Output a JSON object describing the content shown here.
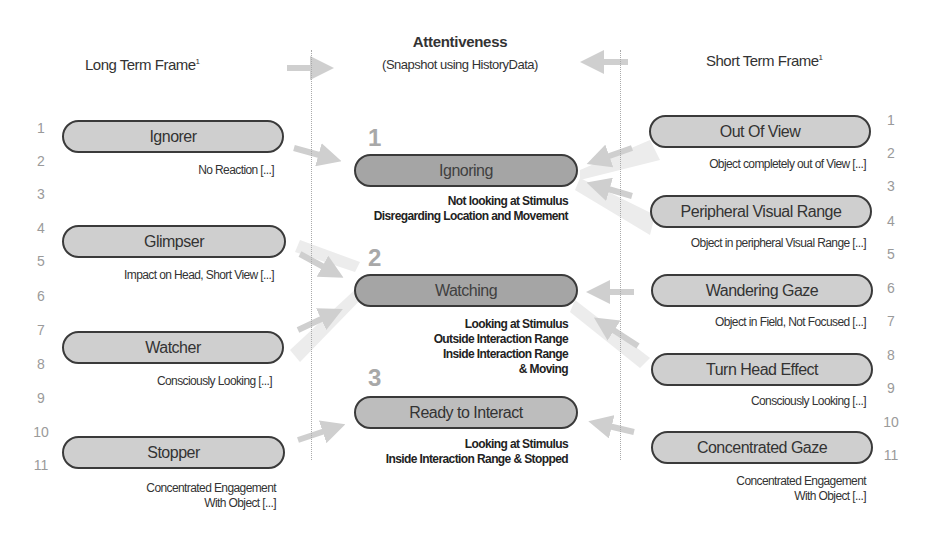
{
  "header": {
    "left": "Long Term Frame",
    "left_sup": "1",
    "center_title": "Attentiveness",
    "center_subtitle": "(Snapshot using HistoryData)",
    "right": "Short Term Frame",
    "right_sup": "1"
  },
  "row_numbers": [
    "1",
    "2",
    "3",
    "4",
    "5",
    "6",
    "7",
    "8",
    "9",
    "10",
    "11"
  ],
  "long_term": [
    {
      "label": "Ignorer",
      "desc": [
        "No Reaction [...]"
      ]
    },
    {
      "label": "Glimpser",
      "desc": [
        "Impact on Head, Short View [...]"
      ]
    },
    {
      "label": "Watcher",
      "desc": [
        "Consciously Looking [...]"
      ]
    },
    {
      "label": "Stopper",
      "desc": [
        "Concentrated Engagement",
        "With Object [...]"
      ]
    }
  ],
  "attentiveness": [
    {
      "number": "1",
      "label": "Ignoring",
      "desc": [
        "Not looking at Stimulus",
        "Disregarding Location and Movement"
      ]
    },
    {
      "number": "2",
      "label": "Watching",
      "desc": [
        "Looking at Stimulus",
        "Outside Interaction Range",
        "Inside Interaction Range",
        "& Moving"
      ]
    },
    {
      "number": "3",
      "label": "Ready to Interact",
      "desc": [
        "Looking at Stimulus",
        "Inside Interaction Range & Stopped"
      ]
    }
  ],
  "short_term": [
    {
      "label": "Out Of View",
      "desc": [
        "Object completely out of View [...]"
      ]
    },
    {
      "label": "Peripheral Visual Range",
      "desc": [
        "Object in peripheral Visual Range [...]"
      ]
    },
    {
      "label": "Wandering Gaze",
      "desc": [
        "Object in Field, Not Focused [...]"
      ]
    },
    {
      "label": "Turn Head Effect",
      "desc": [
        "Consciously Looking [...]"
      ]
    },
    {
      "label": "Concentrated Gaze",
      "desc": [
        "Concentrated Engagement",
        "With Object [...]"
      ]
    }
  ],
  "colors": {
    "pill_light": "#cfcfcf",
    "pill_dark": "#a5a5a5",
    "pill_border": "#3a3a3a",
    "arrow": "#d6d6d6",
    "number_gray": "#9a9a9a"
  }
}
